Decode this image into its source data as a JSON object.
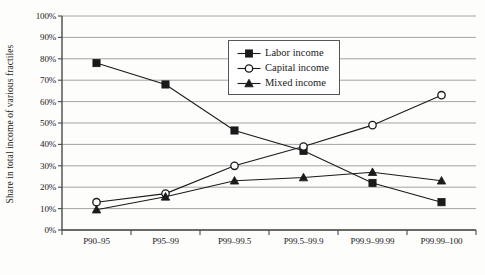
{
  "chart_data": {
    "type": "line",
    "title": "",
    "xlabel": "",
    "ylabel": "Share in total income of various fractiles",
    "categories": [
      "P90–95",
      "P95–99",
      "P99–99.5",
      "P99.5–99.9",
      "P99.9–99.99",
      "P99.99–100"
    ],
    "ylim": [
      0,
      100
    ],
    "ytick_labels": [
      "0%",
      "10%",
      "20%",
      "30%",
      "40%",
      "50%",
      "60%",
      "70%",
      "80%",
      "90%",
      "100%"
    ],
    "ytick_values": [
      0,
      10,
      20,
      30,
      40,
      50,
      60,
      70,
      80,
      90,
      100
    ],
    "grid": true,
    "legend_position": "upper-center",
    "series": [
      {
        "name": "Labor income",
        "marker": "filled-square",
        "values": [
          78,
          68,
          46.5,
          37,
          22,
          13
        ]
      },
      {
        "name": "Capital income",
        "marker": "open-circle",
        "values": [
          13,
          17,
          30,
          39,
          49,
          63
        ]
      },
      {
        "name": "Mixed income",
        "marker": "filled-triangle",
        "values": [
          9.5,
          15.5,
          23,
          24.5,
          27,
          23
        ]
      }
    ]
  },
  "legend": {
    "items": [
      {
        "label": "Labor income",
        "marker": "filled-square"
      },
      {
        "label": "Capital income",
        "marker": "open-circle"
      },
      {
        "label": "Mixed income",
        "marker": "filled-triangle"
      }
    ]
  },
  "colors": {
    "ink": "#1a1a1a",
    "grid": "#9a9a9a",
    "axis": "#4a4a4a",
    "background": "#fdfdfc"
  }
}
